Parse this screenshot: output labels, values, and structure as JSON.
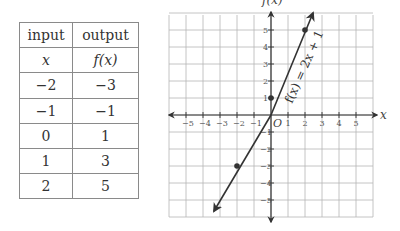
{
  "table": {
    "headers": [
      "input",
      "output"
    ],
    "subheaders": [
      "x",
      "f(x)"
    ],
    "rows": [
      {
        "x": "−2",
        "fx": "−3"
      },
      {
        "x": "−1",
        "fx": "−1"
      },
      {
        "x": "0",
        "fx": "1"
      },
      {
        "x": "1",
        "fx": "3"
      },
      {
        "x": "2",
        "fx": "5"
      }
    ]
  },
  "graph": {
    "x_axis_label": "x",
    "y_axis_label": "f(x)",
    "origin_label": "O",
    "equation_label": "f(x) = 2x + 1",
    "x_ticks": [
      "−5",
      "−4",
      "−3",
      "−2",
      "−1",
      "1",
      "2",
      "3",
      "4",
      "5"
    ],
    "y_ticks": [
      "5",
      "4",
      "3",
      "2",
      "1",
      "−1",
      "−2",
      "−3",
      "−4",
      "−5"
    ],
    "points": [
      {
        "x": -2,
        "y": -3
      },
      {
        "x": 0,
        "y": 1
      },
      {
        "x": 2,
        "y": 5
      }
    ],
    "line_color": "#333333",
    "grid_color": "#b5b5b5"
  },
  "chart_data": {
    "type": "line",
    "title": "",
    "equation": "f(x) = 2x + 1",
    "xlabel": "x",
    "ylabel": "f(x)",
    "xlim": [
      -6,
      6
    ],
    "ylim": [
      -6,
      6
    ],
    "grid": true,
    "series": [
      {
        "name": "f(x) = 2x + 1",
        "x": [
          -2,
          -1,
          0,
          1,
          2
        ],
        "y": [
          -3,
          -1,
          1,
          3,
          5
        ]
      }
    ],
    "marked_points": [
      [
        -2,
        -3
      ],
      [
        0,
        1
      ],
      [
        2,
        5
      ]
    ]
  }
}
